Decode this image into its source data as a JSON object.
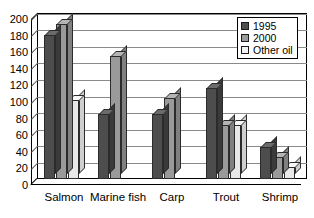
{
  "chart_data": {
    "type": "bar",
    "title": "",
    "subtitle": "",
    "xlabel": "",
    "ylabel": "",
    "ylim": [
      0,
      200
    ],
    "ytick_step": 20,
    "yticks": [
      200,
      180,
      160,
      140,
      120,
      100,
      80,
      60,
      40,
      20,
      0
    ],
    "ytick_labels": [
      "200",
      "180",
      "160",
      "140",
      "120",
      "100",
      "80",
      "60",
      "40",
      "20",
      "0"
    ],
    "grid": true,
    "grid_axis": "y",
    "legend_position": "top-right",
    "style": "3d-column",
    "categories": [
      "Salmon",
      "Marine fish",
      "Carp",
      "Trout",
      "Shrimp"
    ],
    "series": [
      {
        "name": "1995",
        "color": "#4d4d4d",
        "values": [
          173,
          78,
          78,
          110,
          38
        ]
      },
      {
        "name": "2000",
        "color": "#9a9a9a",
        "values": [
          187,
          148,
          98,
          65,
          27
        ]
      },
      {
        "name": "Other oil",
        "color": "#f2f2f2",
        "values": [
          95,
          0,
          0,
          65,
          15
        ]
      }
    ]
  },
  "legend": {
    "entries": [
      {
        "label": "1995",
        "swatch": "dark-gray-swatch"
      },
      {
        "label": "2000",
        "swatch": "medium-gray-swatch"
      },
      {
        "label": "Other oil",
        "swatch": "light-gray-swatch"
      }
    ]
  },
  "colors": {
    "series_1995": "#4d4d4d",
    "series_2000": "#9a9a9a",
    "series_other_oil": "#f2f2f2",
    "axis": "#000000",
    "gridline": "#8a8a8a",
    "background": "#ffffff"
  }
}
